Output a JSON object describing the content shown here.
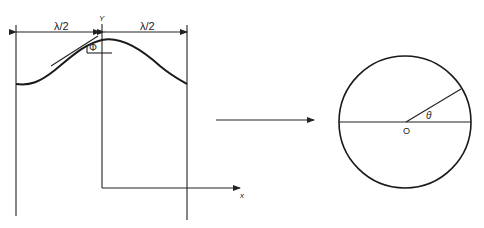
{
  "diagram": {
    "left_panel": {
      "labels": {
        "half_wavelength_left": "λ/2",
        "half_wavelength_right": "λ/2",
        "phase": "Φ",
        "y_axis": "Y",
        "x_axis": "x"
      }
    },
    "transform_arrow": {
      "direction": "right"
    },
    "right_panel": {
      "labels": {
        "origin": "O",
        "angle": "θ"
      }
    },
    "colors": {
      "line": "#222222",
      "background": "#ffffff"
    }
  }
}
